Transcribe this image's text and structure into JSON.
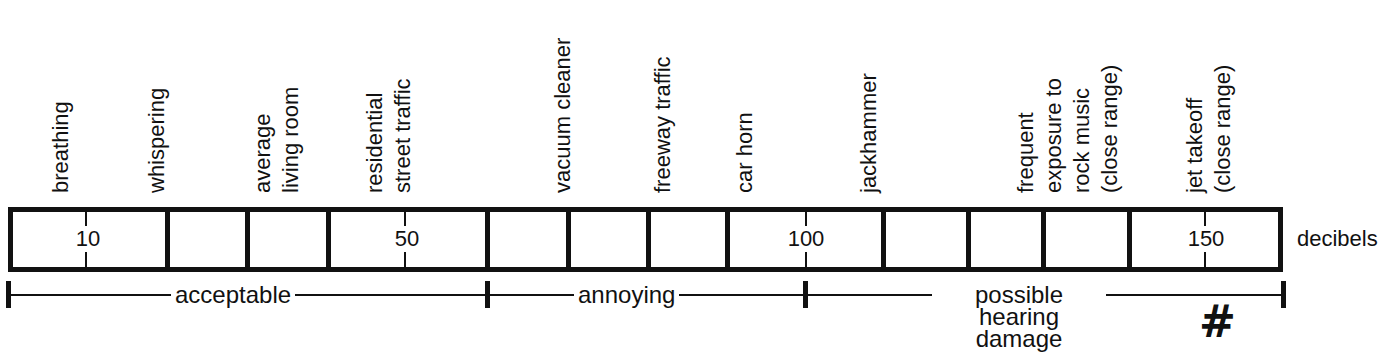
{
  "chart_data": {
    "type": "scale",
    "title": "",
    "unit": "decibels",
    "scale_ticks": [
      {
        "value": 10,
        "label": "10"
      },
      {
        "value": 50,
        "label": "50"
      },
      {
        "value": 100,
        "label": "100"
      },
      {
        "value": 150,
        "label": "150"
      }
    ],
    "segments_count": 15,
    "sound_sources": [
      {
        "label": "breathing",
        "approx_db": 10
      },
      {
        "label": "whispering",
        "approx_db": 20
      },
      {
        "label": "average living room",
        "approx_db": 40
      },
      {
        "label": "residential street traffic",
        "approx_db": 50
      },
      {
        "label": "vacuum cleaner",
        "approx_db": 70
      },
      {
        "label": "freeway traffic",
        "approx_db": 80
      },
      {
        "label": "car horn",
        "approx_db": 90
      },
      {
        "label": "jackhammer",
        "approx_db": 110
      },
      {
        "label": "frequent exposure to rock music (close range)",
        "approx_db": 130
      },
      {
        "label": "jet takeoff (close range)",
        "approx_db": 150
      }
    ],
    "ranges": [
      {
        "label": "acceptable",
        "from": 0,
        "to": 60
      },
      {
        "label": "annoying",
        "from": 60,
        "to": 100
      },
      {
        "label": "possible hearing damage",
        "from": 100,
        "to": 160
      }
    ]
  },
  "labels": {
    "breathing": [
      "breathing"
    ],
    "whispering": [
      "whispering"
    ],
    "living_room": [
      "average",
      "living room"
    ],
    "street": [
      "residential",
      "street traffic"
    ],
    "vacuum": [
      "vacuum cleaner"
    ],
    "freeway": [
      "freeway traffic"
    ],
    "car_horn": [
      "car horn"
    ],
    "jackhammer": [
      "jackhammer"
    ],
    "rock": [
      "frequent",
      "exposure to",
      "rock music",
      "(close range)"
    ],
    "jet": [
      "jet takeoff",
      "(close range)"
    ]
  },
  "scale": {
    "n10": "10",
    "n50": "50",
    "n100": "100",
    "n150": "150",
    "unit": "decibels"
  },
  "ranges": {
    "acceptable": "acceptable",
    "annoying": "annoying",
    "damage_line1": "possible hearing",
    "damage_line2": "damage"
  },
  "annotation": {
    "hash_mark": "#"
  }
}
